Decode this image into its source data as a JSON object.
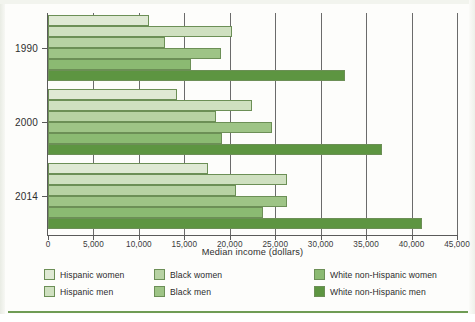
{
  "chart_data": {
    "type": "bar",
    "orientation": "horizontal-grouped",
    "title": "",
    "xlabel": "Median income (dollars)",
    "ylabel": "",
    "xlim": [
      0,
      45000
    ],
    "xticks": [
      0,
      5000,
      10000,
      15000,
      20000,
      25000,
      30000,
      35000,
      40000,
      45000
    ],
    "xtick_labels": [
      "0",
      "5,000",
      "10,000",
      "15,000",
      "20,000",
      "25,000",
      "30,000",
      "35,000",
      "40,000",
      "45,000"
    ],
    "categories": [
      "1990",
      "2000",
      "2014"
    ],
    "grid": "vertical",
    "legend_position": "bottom",
    "series": [
      {
        "name": "Hispanic women",
        "color": "#dfe9d4",
        "values": [
          11100,
          14200,
          17600
        ]
      },
      {
        "name": "Hispanic men",
        "color": "#cfe0c0",
        "values": [
          20200,
          22400,
          26300
        ]
      },
      {
        "name": "Black women",
        "color": "#b7d2a3",
        "values": [
          12900,
          18500,
          20700
        ]
      },
      {
        "name": "Black men",
        "color": "#9ec486",
        "values": [
          19000,
          24600,
          26300
        ]
      },
      {
        "name": "White non-Hispanic women",
        "color": "#8bba72",
        "values": [
          15700,
          19100,
          23700
        ]
      },
      {
        "name": "White non-Hispanic men",
        "color": "#5d9541",
        "values": [
          32700,
          36700,
          41100
        ]
      }
    ]
  },
  "legend": {
    "entries": [
      {
        "label": "Hispanic women",
        "color": "#dfe9d4"
      },
      {
        "label": "Hispanic men",
        "color": "#cfe0c0"
      },
      {
        "label": "Black women",
        "color": "#b7d2a3"
      },
      {
        "label": "Black men",
        "color": "#9ec486"
      },
      {
        "label": "White non-Hispanic women",
        "color": "#8bba72"
      },
      {
        "label": "White non-Hispanic men",
        "color": "#5d9541"
      }
    ]
  },
  "colors": {
    "axis": "#5a5a5a",
    "grid": "#6b6b6b",
    "bar_outline": "#6c8f56",
    "rule": "#6f9c55",
    "background": "#fdfdfb"
  }
}
